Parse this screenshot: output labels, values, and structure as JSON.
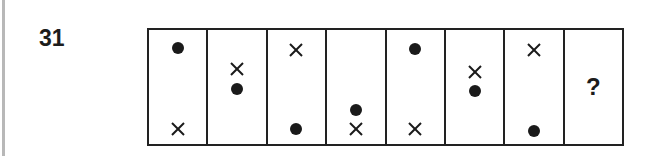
{
  "question": {
    "number": "31",
    "cells": [
      {
        "items": [
          {
            "type": "dot",
            "y": 18
          },
          {
            "type": "cross",
            "y": 99
          }
        ]
      },
      {
        "items": [
          {
            "type": "cross",
            "y": 39
          },
          {
            "type": "dot",
            "y": 59
          }
        ]
      },
      {
        "items": [
          {
            "type": "cross",
            "y": 20
          },
          {
            "type": "dot",
            "y": 99
          }
        ]
      },
      {
        "items": [
          {
            "type": "dot",
            "y": 80
          },
          {
            "type": "cross",
            "y": 99
          }
        ]
      },
      {
        "items": [
          {
            "type": "dot",
            "y": 19
          },
          {
            "type": "cross",
            "y": 99
          }
        ]
      },
      {
        "items": [
          {
            "type": "cross",
            "y": 42
          },
          {
            "type": "dot",
            "y": 61
          }
        ]
      },
      {
        "items": [
          {
            "type": "cross",
            "y": 20
          },
          {
            "type": "dot",
            "y": 101
          }
        ]
      },
      {
        "unknown": "?"
      }
    ]
  },
  "colors": {
    "ink": "#1a1a1a",
    "background": "#ffffff",
    "edge_strip": "#b8b8b8"
  }
}
